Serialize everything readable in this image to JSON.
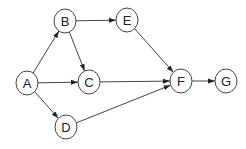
{
  "diagram": {
    "type": "directed-graph",
    "nodes": [
      {
        "id": "A",
        "label": "A",
        "x": 27,
        "y": 83,
        "rx": 11,
        "ry": 12
      },
      {
        "id": "B",
        "label": "B",
        "x": 65,
        "y": 21,
        "rx": 11,
        "ry": 12
      },
      {
        "id": "C",
        "label": "C",
        "x": 89,
        "y": 82,
        "rx": 11,
        "ry": 12
      },
      {
        "id": "D",
        "label": "D",
        "x": 66,
        "y": 127,
        "rx": 11,
        "ry": 12
      },
      {
        "id": "E",
        "label": "E",
        "x": 127,
        "y": 20,
        "rx": 11,
        "ry": 12
      },
      {
        "id": "F",
        "label": "F",
        "x": 181,
        "y": 81,
        "rx": 11,
        "ry": 12
      },
      {
        "id": "G",
        "label": "G",
        "x": 226,
        "y": 81,
        "rx": 11,
        "ry": 12
      }
    ],
    "edges": [
      {
        "from": "A",
        "to": "B"
      },
      {
        "from": "A",
        "to": "C"
      },
      {
        "from": "A",
        "to": "D"
      },
      {
        "from": "B",
        "to": "C"
      },
      {
        "from": "B",
        "to": "E"
      },
      {
        "from": "E",
        "to": "F"
      },
      {
        "from": "C",
        "to": "F"
      },
      {
        "from": "D",
        "to": "F"
      },
      {
        "from": "F",
        "to": "G"
      }
    ]
  }
}
